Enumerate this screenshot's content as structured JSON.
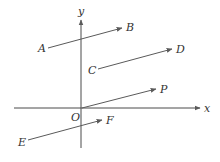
{
  "diagram": {
    "type": "vector-diagram",
    "colors": {
      "background": "#ffffff",
      "axis": "#4a4a4a",
      "vector": "#5a5a5a",
      "label": "#333333"
    },
    "axes": {
      "x": {
        "label": "x",
        "from": [
          14,
          108
        ],
        "to": [
          200,
          108
        ],
        "label_pos": [
          204,
          112
        ]
      },
      "y": {
        "label": "y",
        "from": [
          81,
          148
        ],
        "to": [
          81,
          20
        ],
        "label_pos": [
          78,
          15
        ]
      },
      "origin": {
        "label": "O",
        "pos": [
          71,
          121
        ]
      }
    },
    "vectors": [
      {
        "name": "AB",
        "start_label": "A",
        "end_label": "B",
        "from": [
          48,
          48
        ],
        "to": [
          122,
          28
        ],
        "start_label_pos": [
          38,
          52
        ],
        "end_label_pos": [
          126,
          31
        ]
      },
      {
        "name": "CD",
        "start_label": "C",
        "end_label": "D",
        "from": [
          98,
          69
        ],
        "to": [
          172,
          49
        ],
        "start_label_pos": [
          88,
          74
        ],
        "end_label_pos": [
          176,
          53
        ]
      },
      {
        "name": "OP",
        "start_label": "O",
        "end_label": "P",
        "from": [
          82,
          108
        ],
        "to": [
          156,
          89
        ],
        "start_label_pos": null,
        "end_label_pos": [
          160,
          93
        ]
      },
      {
        "name": "EF",
        "start_label": "E",
        "end_label": "F",
        "from": [
          28,
          140
        ],
        "to": [
          102,
          120
        ],
        "start_label_pos": [
          18,
          146
        ],
        "end_label_pos": [
          106,
          124
        ]
      }
    ]
  }
}
